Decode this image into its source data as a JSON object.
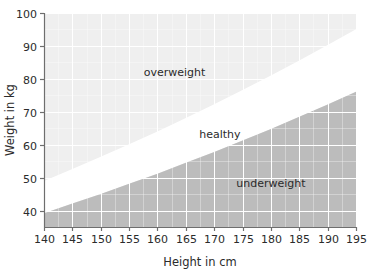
{
  "chart_data": {
    "type": "area",
    "title": "",
    "xlabel": "Height in cm",
    "ylabel": "Weight in kg",
    "xlim": [
      140,
      195
    ],
    "ylim": [
      35,
      100
    ],
    "grid": true,
    "legend": "none",
    "xticks": [
      "140",
      "145",
      "150",
      "155",
      "160",
      "165",
      "170",
      "175",
      "180",
      "185",
      "190",
      "195"
    ],
    "yticks": [
      "40",
      "50",
      "60",
      "70",
      "80",
      "90",
      "100"
    ],
    "regions": [
      {
        "name": "overweight",
        "label": "overweight",
        "color": "#efefef",
        "bmi_boundary_low": 25,
        "description": "area above the BMI 25 curve",
        "label_x": 163,
        "label_y": 81
      },
      {
        "name": "healthy",
        "label": "healthy",
        "color": "#ffffff",
        "bmi_boundary_low": 20,
        "bmi_boundary_high": 25,
        "description": "band between the BMI 20 and BMI 25 curves",
        "label_x": 171,
        "label_y": 62
      },
      {
        "name": "underweight",
        "label": "underweight",
        "color": "#bcbcbc",
        "bmi_boundary_high": 20,
        "description": "area below the BMI 20 curve",
        "label_x": 180,
        "label_y": 47
      }
    ],
    "curves": [
      {
        "name": "bmi-25-boundary",
        "bmi": 25,
        "x": [
          140,
          145,
          150,
          155,
          160,
          165,
          170,
          175,
          180,
          185,
          190,
          195
        ],
        "y": [
          49.0,
          52.6,
          56.3,
          60.1,
          64.0,
          68.1,
          72.3,
          76.6,
          81.0,
          85.6,
          90.3,
          95.1
        ]
      },
      {
        "name": "bmi-20-boundary",
        "bmi": 20,
        "x": [
          140,
          145,
          150,
          155,
          160,
          165,
          170,
          175,
          180,
          185,
          190,
          195
        ],
        "y": [
          39.2,
          42.1,
          45.0,
          48.1,
          51.2,
          54.5,
          57.8,
          61.3,
          64.8,
          68.5,
          72.2,
          76.1
        ]
      }
    ],
    "gridline_color": "#ffffff",
    "axis_color": "#6e6e6e",
    "text_color": "#2b2b2b"
  },
  "axes": {
    "y_title": "Weight in kg",
    "x_title": "Height in cm"
  }
}
